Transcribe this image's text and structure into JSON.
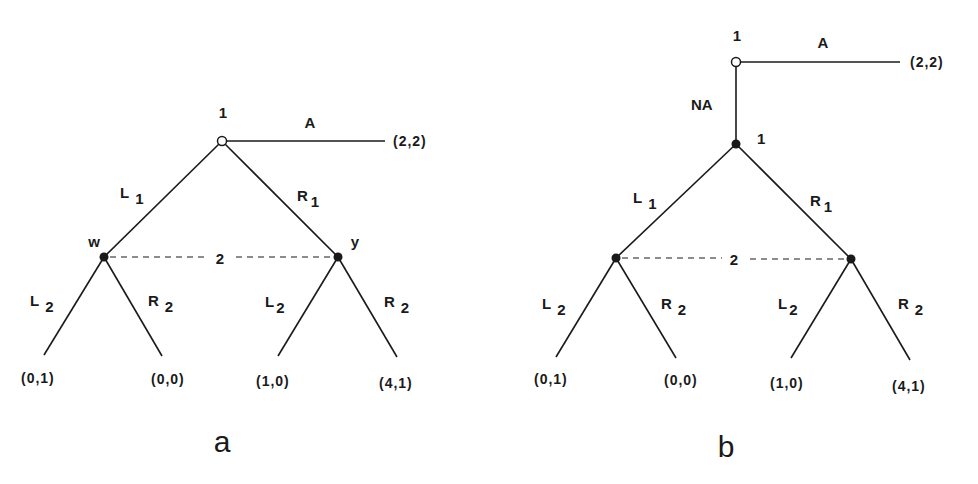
{
  "figure": {
    "panels": [
      {
        "caption": "a",
        "root": {
          "player": "1",
          "type": "open",
          "action_exit": "A",
          "exit_payoff": "(2,2)"
        },
        "first_moves": [
          {
            "label": "L",
            "sub": "1"
          },
          {
            "label": "R",
            "sub": "1"
          }
        ],
        "info_set": {
          "player": "2",
          "node_labels": [
            "w",
            "y"
          ]
        },
        "second_moves": [
          {
            "label": "L",
            "sub": "2"
          },
          {
            "label": "R",
            "sub": "2"
          },
          {
            "label": "L",
            "sub": "2"
          },
          {
            "label": "R",
            "sub": "2"
          }
        ],
        "payoffs": [
          "(0,1)",
          "(0,0)",
          "(1,0)",
          "(4,1)"
        ]
      },
      {
        "caption": "b",
        "root": {
          "player": "1",
          "type": "open",
          "action_exit": "A",
          "exit_payoff": "(2,2)",
          "action_continue": "NA"
        },
        "second_node": {
          "player": "1",
          "type": "filled"
        },
        "first_moves": [
          {
            "label": "L",
            "sub": "1"
          },
          {
            "label": "R",
            "sub": "1"
          }
        ],
        "info_set": {
          "player": "2"
        },
        "second_moves": [
          {
            "label": "L",
            "sub": "2"
          },
          {
            "label": "R",
            "sub": "2"
          },
          {
            "label": "L",
            "sub": "2"
          },
          {
            "label": "R",
            "sub": "2"
          }
        ],
        "payoffs": [
          "(0,1)",
          "(0,0)",
          "(1,0)",
          "(4,1)"
        ]
      }
    ],
    "colors": {
      "ink": "#1a1a1a",
      "background": "#ffffff"
    }
  }
}
